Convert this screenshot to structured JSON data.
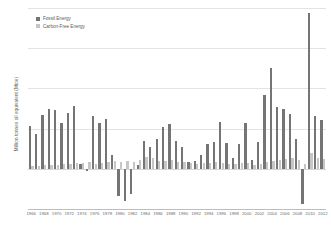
{
  "chart_data": {
    "type": "bar",
    "title": "",
    "subtitle": "",
    "xlabel": "",
    "ylabel": "Million tonnes oil equivalent (Mtoe)",
    "ylim": [
      -175,
      700
    ],
    "yticks": [
      700,
      525,
      350,
      175,
      0,
      -175
    ],
    "ytick_labels": [
      "700",
      "525",
      "350",
      "175",
      "0",
      "-175"
    ],
    "grid": true,
    "legend_position": "top-left",
    "orientation": "vertical",
    "bar_mode": "grouped",
    "colors": {
      "fossil": "#757575",
      "carbon_free": "#c6c6c6",
      "gridline": "#e3e3e3",
      "axis": "#bdbdbd",
      "text": "#6b6b6b",
      "background": "#ffffff"
    },
    "legend": [
      {
        "name": "Fossil Energy",
        "color": "#757575"
      },
      {
        "name": "Carbon-Free Energy",
        "color": "#c6c6c6"
      }
    ],
    "categories": [
      "1966",
      "1967",
      "1968",
      "1969",
      "1970",
      "1971",
      "1972",
      "1973",
      "1974",
      "1975",
      "1976",
      "1977",
      "1978",
      "1979",
      "1980",
      "1981",
      "1982",
      "1983",
      "1984",
      "1985",
      "1986",
      "1987",
      "1988",
      "1989",
      "1990",
      "1991",
      "1992",
      "1993",
      "1994",
      "1995",
      "1996",
      "1997",
      "1998",
      "1999",
      "2000",
      "2001",
      "2002",
      "2003",
      "2004",
      "2005",
      "2006",
      "2007",
      "2008",
      "2009",
      "2010",
      "2011",
      "2012"
    ],
    "xtick_labels": [
      "1966",
      "1968",
      "1970",
      "1972",
      "1974",
      "1976",
      "1978",
      "1980",
      "1982",
      "1984",
      "1986",
      "1988",
      "1990",
      "1992",
      "1994",
      "1996",
      "1998",
      "2000",
      "2002",
      "2004",
      "2006",
      "2008",
      "2010",
      "2012"
    ],
    "series": [
      {
        "name": "Fossil Energy",
        "color": "#757575",
        "values": [
          188,
          150,
          235,
          262,
          258,
          200,
          245,
          275,
          20,
          -8,
          232,
          198,
          215,
          60,
          -120,
          -140,
          -110,
          18,
          120,
          96,
          128,
          182,
          195,
          122,
          95,
          28,
          34,
          62,
          108,
          118,
          205,
          112,
          45,
          110,
          198,
          40,
          118,
          320,
          438,
          268,
          262,
          240,
          130,
          -155,
          678,
          232,
          212
        ]
      },
      {
        "name": "Carbon-Free Energy",
        "color": "#c6c6c6",
        "values": [
          14,
          12,
          18,
          16,
          18,
          20,
          22,
          24,
          26,
          28,
          22,
          26,
          30,
          34,
          30,
          36,
          30,
          40,
          52,
          48,
          34,
          36,
          40,
          30,
          28,
          24,
          20,
          26,
          24,
          28,
          26,
          20,
          22,
          24,
          26,
          18,
          22,
          30,
          36,
          40,
          44,
          46,
          40,
          22,
          70,
          46,
          44
        ]
      }
    ]
  }
}
